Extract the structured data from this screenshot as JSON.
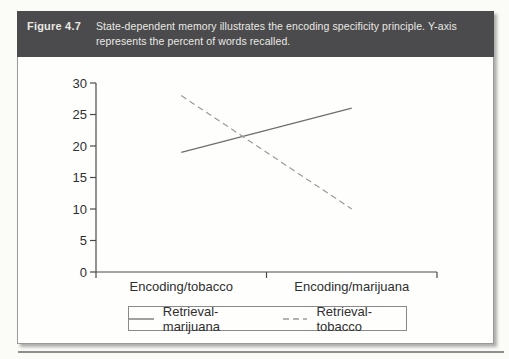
{
  "figure": {
    "label": "Figure 4.7",
    "caption_lines": [
      "State-dependent memory illustrates the encoding specificity principle. Y-axis",
      "represents the percent of words recalled."
    ]
  },
  "colors": {
    "header_bg": "#4b4b4d",
    "header_text": "#e9e9e4",
    "axis": "#4a4a4a",
    "series_solid": "#6e6e6e",
    "series_dashed": "#9a9a9a",
    "rule": "#8e8e8e"
  },
  "chart_data": {
    "type": "line",
    "title": "",
    "xlabel": "",
    "ylabel": "",
    "categories": [
      "Encoding/tobacco",
      "Encoding/marijuana"
    ],
    "series": [
      {
        "name": "Retrieval-marijuana",
        "line_style": "solid",
        "values": [
          19,
          26
        ]
      },
      {
        "name": "Retrieval-tobacco",
        "line_style": "dashed",
        "values": [
          28,
          10
        ]
      }
    ],
    "ylim": [
      0,
      30
    ],
    "yticks": [
      0,
      5,
      10,
      15,
      20,
      25,
      30
    ],
    "grid": false,
    "legend_position": "bottom"
  }
}
